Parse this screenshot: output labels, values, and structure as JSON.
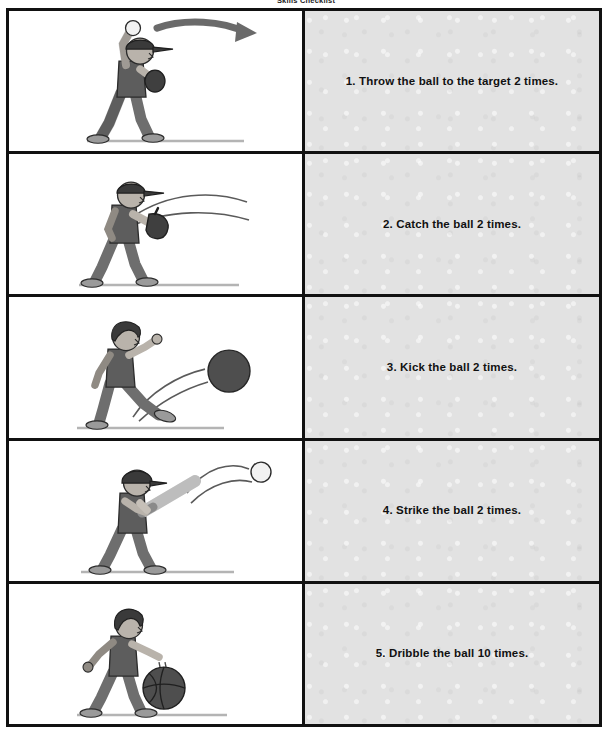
{
  "header": {
    "title": "Skills Checklist"
  },
  "worksheet": {
    "rows": [
      {
        "index": "1",
        "instruction": "1. Throw the ball to the target 2 times.",
        "illustration_name": "child-throwing-ball-overhead",
        "illustration_alt": "Child wearing a cap throwing a ball overhead with a curved arrow showing the throw direction"
      },
      {
        "index": "2",
        "instruction": "2. Catch the ball 2 times.",
        "illustration_name": "child-catching-ball-with-glove",
        "illustration_alt": "Child wearing a cap holding a baseball glove out with motion lines of an incoming ball"
      },
      {
        "index": "3",
        "instruction": "3. Kick the ball 2 times.",
        "illustration_name": "child-kicking-ball",
        "illustration_alt": "Child kicking a dark gray ball with motion lines trailing behind it"
      },
      {
        "index": "4",
        "instruction": "4. Strike the ball 2 times.",
        "illustration_name": "child-striking-ball-with-bat",
        "illustration_alt": "Child wearing a batting helmet swinging a bat as a white ball flies away on an arc"
      },
      {
        "index": "5",
        "instruction": "5. Dribble the ball 10 times.",
        "illustration_name": "child-dribbling-basketball",
        "illustration_alt": "Child bouncing a basketball with one hand"
      }
    ]
  },
  "colors": {
    "border": "#111111",
    "text_panel_background": "#e2e2e2",
    "illustration_panel_background": "#ffffff",
    "skin": "#b9b3ab",
    "shirt": "#5d5d5d",
    "pants": "#6e6e6e",
    "cap": "#3a3a3a",
    "hair": "#3a3a3a",
    "shoe": "#9a9a9a",
    "ball_dark": "#4e4e4e",
    "ball_light": "#f2f2f2",
    "bat": "#cfcfcf",
    "ground": "#c8c8c8"
  }
}
